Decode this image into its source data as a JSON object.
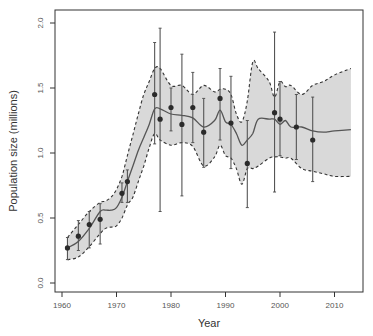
{
  "chart_data": {
    "type": "line",
    "title": "",
    "xlabel": "Year",
    "ylabel": "Population size (millions)",
    "xlim": [
      1959.5,
      2015.5
    ],
    "ylim": [
      -0.05,
      2.05
    ],
    "grid": false,
    "legend": null,
    "x_ticks": [
      1960,
      1970,
      1980,
      1990,
      2000,
      2010
    ],
    "x_tick_labels": [
      "1960",
      "1970",
      "1980",
      "1990",
      "2000",
      "2010"
    ],
    "y_ticks": [
      0.0,
      0.5,
      1.0,
      1.5,
      2.0
    ],
    "y_tick_labels": [
      "0.0",
      "0.5",
      "1.0",
      "1.5",
      "2.0"
    ],
    "observations": {
      "name": "Survey estimates (± error)",
      "points": [
        {
          "year": 1961,
          "value": 0.27,
          "lo": 0.18,
          "hi": 0.35
        },
        {
          "year": 1963,
          "value": 0.36,
          "lo": 0.25,
          "hi": 0.48
        },
        {
          "year": 1965,
          "value": 0.45,
          "lo": 0.27,
          "hi": 0.55
        },
        {
          "year": 1967,
          "value": 0.49,
          "lo": 0.3,
          "hi": 0.61
        },
        {
          "year": 1971,
          "value": 0.69,
          "lo": 0.62,
          "hi": 0.77
        },
        {
          "year": 1972,
          "value": 0.78,
          "lo": 0.62,
          "hi": 0.87
        },
        {
          "year": 1977,
          "value": 1.45,
          "lo": 1.07,
          "hi": 1.85
        },
        {
          "year": 1978,
          "value": 1.26,
          "lo": 0.55,
          "hi": 1.96
        },
        {
          "year": 1980,
          "value": 1.35,
          "lo": 1.17,
          "hi": 1.5
        },
        {
          "year": 1982,
          "value": 1.22,
          "lo": 0.67,
          "hi": 1.76
        },
        {
          "year": 1984,
          "value": 1.35,
          "lo": 1.08,
          "hi": 1.62
        },
        {
          "year": 1986,
          "value": 1.16,
          "lo": 0.89,
          "hi": 1.42
        },
        {
          "year": 1989,
          "value": 1.42,
          "lo": 1.1,
          "hi": 1.65
        },
        {
          "year": 1991,
          "value": 1.23,
          "lo": 0.88,
          "hi": 1.59
        },
        {
          "year": 1994,
          "value": 0.92,
          "lo": 0.58,
          "hi": 1.25
        },
        {
          "year": 1999,
          "value": 1.31,
          "lo": 0.7,
          "hi": 1.93
        },
        {
          "year": 2000,
          "value": 1.26,
          "lo": 0.98,
          "hi": 1.55
        },
        {
          "year": 2003,
          "value": 1.2,
          "lo": 0.95,
          "hi": 1.45
        },
        {
          "year": 2006,
          "value": 1.1,
          "lo": 0.78,
          "hi": 1.43
        }
      ]
    },
    "model": {
      "name": "Estimated trajectory with credible interval",
      "x": [
        1961,
        1963,
        1965,
        1967,
        1968,
        1969,
        1970,
        1971,
        1972,
        1973,
        1974,
        1975,
        1976,
        1977,
        1978,
        1980,
        1982,
        1984,
        1986,
        1988,
        1989,
        1990,
        1991,
        1992,
        1993,
        1994,
        1995,
        1996,
        1998,
        1999,
        2000,
        2001,
        2002,
        2004,
        2006,
        2008,
        2010,
        2013
      ],
      "mean": [
        0.27,
        0.32,
        0.42,
        0.55,
        0.56,
        0.56,
        0.58,
        0.66,
        0.78,
        0.9,
        1.02,
        1.12,
        1.22,
        1.34,
        1.34,
        1.3,
        1.29,
        1.27,
        1.2,
        1.25,
        1.33,
        1.24,
        1.22,
        1.15,
        1.06,
        1.1,
        1.15,
        1.26,
        1.26,
        1.26,
        1.22,
        1.25,
        1.2,
        1.2,
        1.17,
        1.16,
        1.17,
        1.18
      ],
      "upper": [
        0.35,
        0.45,
        0.55,
        0.62,
        0.63,
        0.66,
        0.72,
        0.82,
        0.98,
        1.14,
        1.3,
        1.45,
        1.55,
        1.65,
        1.65,
        1.52,
        1.52,
        1.45,
        1.52,
        1.47,
        1.49,
        1.49,
        1.45,
        1.3,
        1.24,
        1.4,
        1.7,
        1.65,
        1.55,
        1.43,
        1.55,
        1.51,
        1.52,
        1.45,
        1.52,
        1.55,
        1.6,
        1.65
      ],
      "lower": [
        0.18,
        0.2,
        0.28,
        0.38,
        0.42,
        0.43,
        0.44,
        0.5,
        0.6,
        0.66,
        0.78,
        0.9,
        1.04,
        1.15,
        1.1,
        1.06,
        1.08,
        1.05,
        0.9,
        0.97,
        1.06,
        0.98,
        0.96,
        0.88,
        0.76,
        0.88,
        0.88,
        0.9,
        0.96,
        0.97,
        0.97,
        0.96,
        0.96,
        0.88,
        0.86,
        0.84,
        0.82,
        0.82
      ]
    },
    "colors": {
      "band_fill": "#d9d9d9",
      "band_edge": "#333333",
      "line": "#555555",
      "points": "#2b2b2b",
      "errorbars": "#555555",
      "axes": "#333333"
    }
  }
}
